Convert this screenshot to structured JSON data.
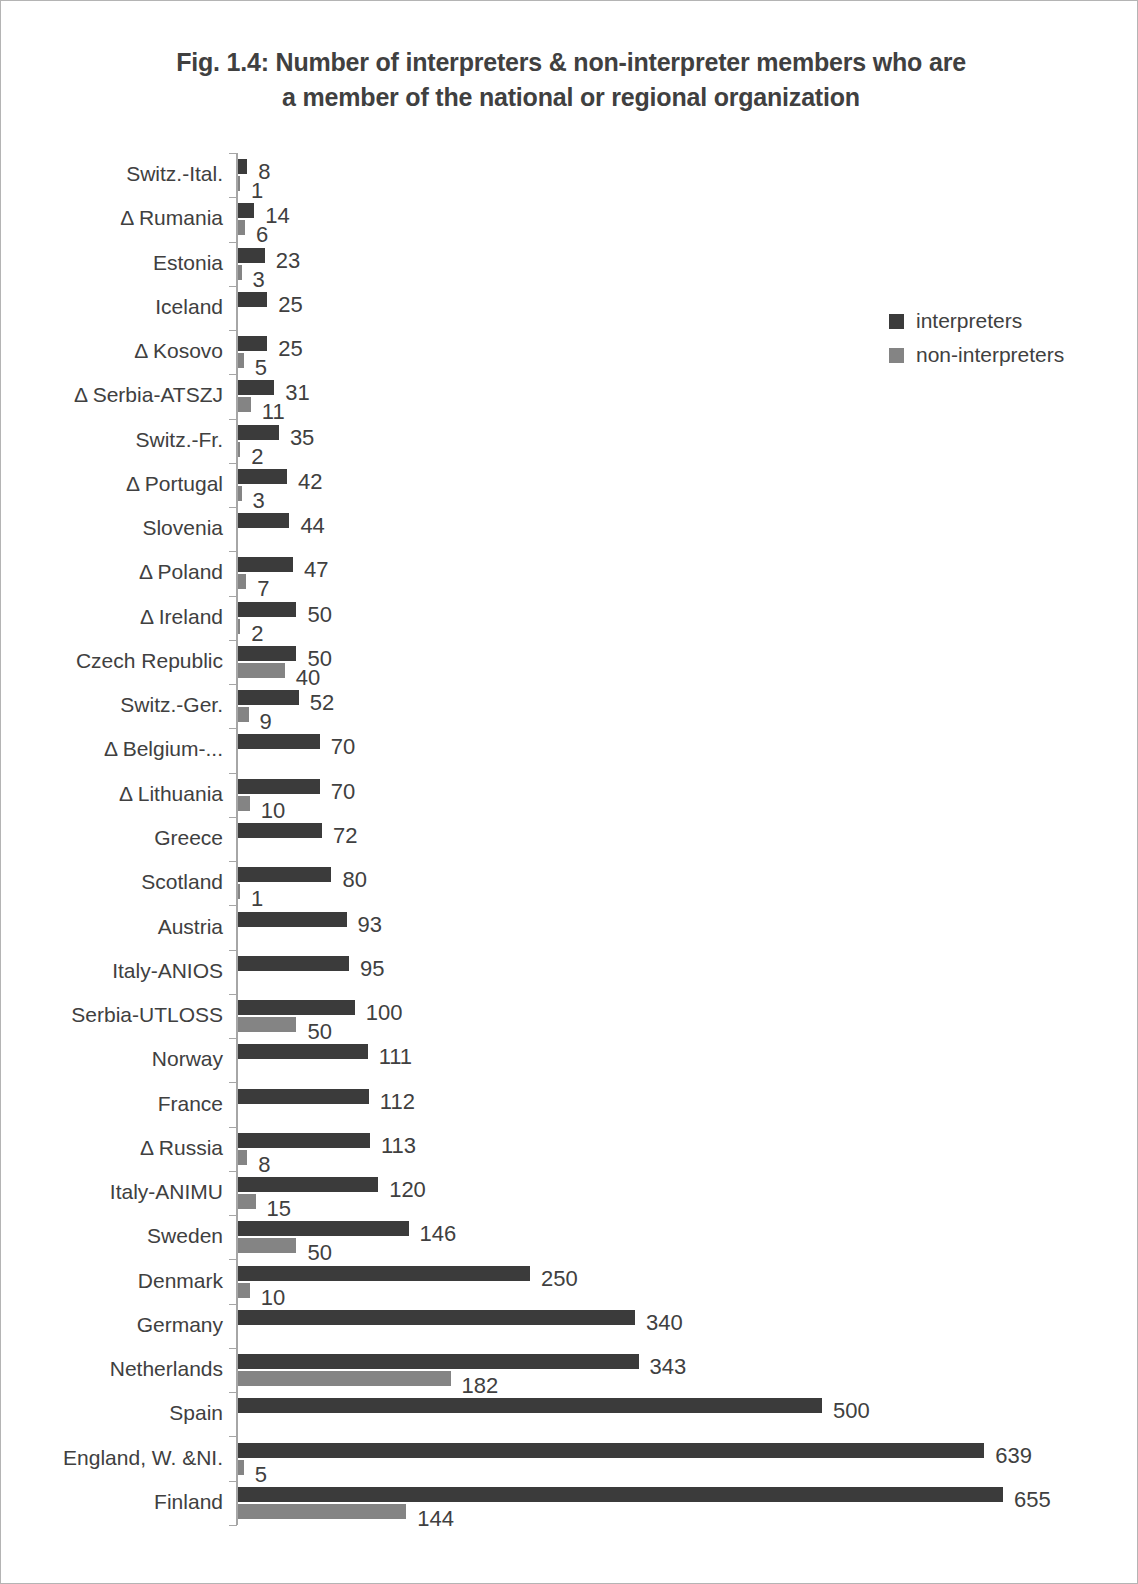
{
  "title": {
    "line1": "Fig. 1.4: Number of interpreters & non-interpreter members who are",
    "line2": "a member of the national or regional organization"
  },
  "legend": {
    "items": [
      {
        "label": "interpreters",
        "color": "#3b3b3b"
      },
      {
        "label": "non-interpreters",
        "color": "#848484"
      }
    ]
  },
  "chart_data": {
    "type": "bar",
    "orientation": "horizontal",
    "title": "Fig. 1.4: Number of interpreters & non-interpreter members who are a member of the national or regional organization",
    "xlabel": "",
    "ylabel": "",
    "grid": false,
    "legend_position": "right",
    "xlim": [
      0,
      655
    ],
    "categories": [
      "Switz.-Ital.",
      "Δ Rumania",
      "Estonia",
      "Iceland",
      "Δ  Kosovo",
      "Δ  Serbia-ATSZJ",
      "Switz.-Fr.",
      "Δ  Portugal",
      "Slovenia",
      "Δ  Poland",
      "Δ  Ireland",
      "Czech Republic",
      "Switz.-Ger.",
      "Δ  Belgium-...",
      "Δ  Lithuania",
      "Greece",
      "Scotland",
      "Austria",
      "Italy-ANIOS",
      "Serbia-UTLOSS",
      "Norway",
      "France",
      "Δ Russia",
      "Italy-ANIMU",
      "Sweden",
      "Denmark",
      "Germany",
      "Netherlands",
      "Spain",
      "England, W. &NI.",
      "Finland"
    ],
    "series": [
      {
        "name": "interpreters",
        "color": "#3b3b3b",
        "values": [
          8,
          14,
          23,
          25,
          25,
          31,
          35,
          42,
          44,
          47,
          50,
          50,
          52,
          70,
          70,
          72,
          80,
          93,
          95,
          100,
          111,
          112,
          113,
          120,
          146,
          250,
          340,
          343,
          500,
          639,
          655
        ]
      },
      {
        "name": "non-interpreters",
        "color": "#848484",
        "values": [
          1,
          6,
          3,
          null,
          5,
          11,
          2,
          3,
          null,
          7,
          2,
          40,
          9,
          null,
          10,
          null,
          1,
          null,
          null,
          50,
          null,
          null,
          8,
          15,
          50,
          10,
          null,
          182,
          null,
          5,
          144
        ]
      }
    ]
  }
}
